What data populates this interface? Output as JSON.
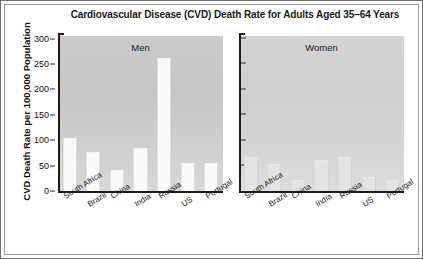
{
  "chart_data": {
    "type": "bar",
    "title": "Cardiovascular Disease (CVD) Death Rate for Adults Aged 35–64 Years",
    "xlabel": "",
    "ylabel": "CVD Death Rate per 100,000 Population",
    "ylim": [
      0,
      300
    ],
    "yticks": [
      0,
      50,
      100,
      150,
      200,
      250,
      300
    ],
    "ytick_labels": [
      "0",
      "50",
      "100",
      "150",
      "200",
      "250",
      "300"
    ],
    "grid": false,
    "legend": "none",
    "panels": [
      "Men",
      "Women"
    ],
    "categories": [
      "South Africa",
      "Brazil",
      "China",
      "India",
      "Russia",
      "US",
      "Portugal"
    ],
    "series": [
      {
        "name": "Men",
        "values": [
          103,
          75,
          41,
          83,
          258,
          55,
          54
        ]
      },
      {
        "name": "Women",
        "values": [
          65,
          52,
          22,
          60,
          65,
          27,
          22
        ]
      }
    ]
  },
  "figure": {
    "title": "Cardiovascular Disease (CVD) Death Rate for Adults Aged 35–64 Years",
    "y_axis_title": "CVD Death Rate per 100,000 Population",
    "panel_men_label": "Men",
    "panel_women_label": "Women",
    "ytick_labels": [
      "300",
      "250",
      "200",
      "150",
      "100",
      "50",
      "0"
    ],
    "categories": [
      "South Africa",
      "Brazil",
      "China",
      "India",
      "Russia",
      "US",
      "Portugal"
    ]
  }
}
